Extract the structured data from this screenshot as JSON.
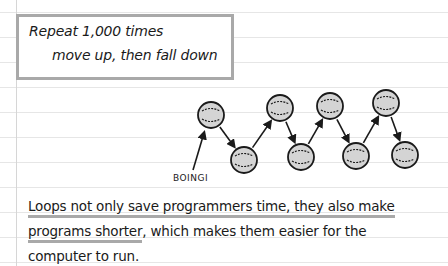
{
  "code_box": {
    "line1": "Repeat 1,000 times",
    "line2": "move up, then fall down"
  },
  "diagram": {
    "label": "BOINGI",
    "balls": [
      {
        "name": "ball-1",
        "position": "up"
      },
      {
        "name": "ball-2",
        "position": "down"
      },
      {
        "name": "ball-3",
        "position": "up"
      },
      {
        "name": "ball-4",
        "position": "down"
      },
      {
        "name": "ball-5",
        "position": "up"
      },
      {
        "name": "ball-6",
        "position": "down"
      },
      {
        "name": "ball-7",
        "position": "up"
      },
      {
        "name": "ball-8",
        "position": "down"
      }
    ],
    "ball_fill": "#d4d4d4",
    "ink": "#1a1a1a"
  },
  "paragraph": {
    "line1_underlined": "Loops not only save programmers time, they also make",
    "line2_underlined": "programs shorter",
    "line2_rest": ", which makes them easier for the",
    "line3": "computer to run."
  },
  "colors": {
    "rule": "#e6e6e6",
    "highlight": "#a9a9a9"
  }
}
